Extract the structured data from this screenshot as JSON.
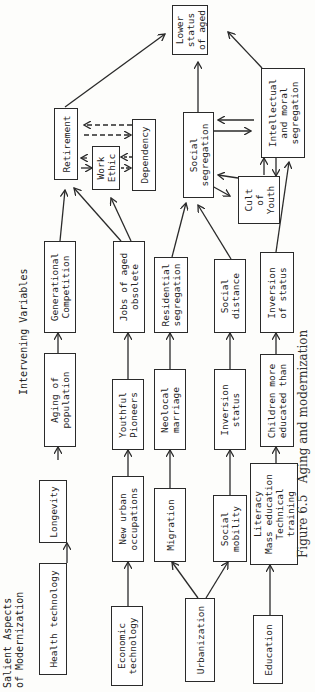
{
  "headers": {
    "salient": "Salient Aspects\nof Modernization",
    "intervening": "Intervening Variables"
  },
  "caption": "Figure 6.5   Aging and modernization",
  "nodes": {
    "health_technology": "Health technology",
    "economic_technology": "Economic\ntechnology",
    "urbanization": "Urbanization",
    "education": "Education",
    "longevity": "Longevity",
    "new_urban_occupations": "New urban\noccupations",
    "migration": "Migration",
    "social_mobility": "Social\nmobility",
    "literacy": "Literacy\nMass education\nTechnical\ntraining",
    "aging_of_population": "Aging of\npopulation",
    "youthful_pioneers": "Youthful\nPioneers",
    "neolocal_marriage": "Neolocal\nmarriage",
    "inversion_status": "Inversion\nstatus",
    "children_more_educated": "Children more\neducated than",
    "generational_competition": "Generational\nCompetition",
    "jobs_of_aged_obsolete": "Jobs of aged\nobsolete",
    "residential_segregation": "Residential\nsegregation",
    "social_distance": "Social\ndistance",
    "inversion_of_status": "Inversion\nof status",
    "retirement": "Retirement",
    "work_ethic": "Work\nEthic",
    "dependency": "Dependency",
    "social_segregation": "Social\nsegregation",
    "cult_of_youth": "Cult\nof\nYouth",
    "intellectual_moral_segregation": "Intellectual\nand moral\nsegregation",
    "lower_status_of_aged": "Lower\nstatus\nof aged"
  }
}
